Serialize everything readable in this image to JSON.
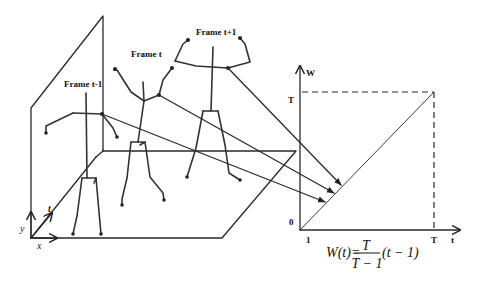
{
  "diagram": {
    "frames": [
      {
        "label": "Frame t-1"
      },
      {
        "label": "Frame t"
      },
      {
        "label": "Frame t+1"
      }
    ],
    "space_axes": {
      "x": "x",
      "y": "y",
      "t": "t"
    },
    "graph": {
      "y_axis_label": "W",
      "x_axis_label": "t",
      "y_ticks": [
        "T",
        "0"
      ],
      "x_ticks": [
        "1",
        "T"
      ]
    },
    "formula": {
      "lhs": "W(t)=",
      "numerator": "T",
      "denominator": "T − 1",
      "rhs": "(t − 1)"
    },
    "colors": {
      "line": "#2a2a2a",
      "background": "#ffffff"
    }
  }
}
